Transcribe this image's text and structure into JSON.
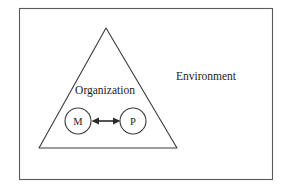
{
  "diagram": {
    "background_color": "#ffffff",
    "frame": {
      "name": "outer-frame",
      "stroke_color": "#5a5a5a"
    },
    "regions": [
      {
        "id": "environment",
        "label": "Environment",
        "shape": "rectangle-area",
        "label_x": 176,
        "label_y": 80
      },
      {
        "id": "organization",
        "label": "Organization",
        "shape": "triangle",
        "stroke_color": "#3a3a3a",
        "label_x": 105,
        "label_y": 94
      }
    ],
    "nodes": [
      {
        "id": "m",
        "label": "M",
        "shape": "circle",
        "cx": 78,
        "cy": 121,
        "r": 13,
        "stroke_color": "#3a3a3a",
        "fill_color": "#ffffff"
      },
      {
        "id": "p",
        "label": "P",
        "shape": "circle",
        "cx": 133,
        "cy": 121,
        "r": 13,
        "stroke_color": "#3a3a3a",
        "fill_color": "#ffffff"
      }
    ],
    "connectors": [
      {
        "id": "m-p-link",
        "from": "m",
        "to": "p",
        "style": "double-headed-arrow",
        "color": "#2a2a2a"
      }
    ]
  }
}
